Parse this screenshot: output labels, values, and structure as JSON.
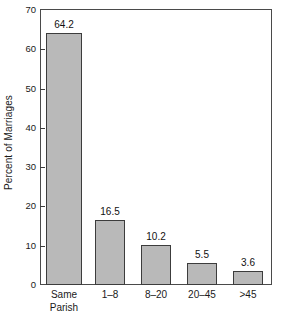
{
  "chart_data": {
    "type": "bar",
    "title": "",
    "xlabel": "",
    "ylabel": "Percent of Marriages",
    "categories": [
      "Same Parish",
      "1–8",
      "8–20",
      "20–45",
      ">45"
    ],
    "category_lines": [
      [
        "Same",
        "Parish"
      ],
      [
        "1–8"
      ],
      [
        "8–20"
      ],
      [
        "20–45"
      ],
      [
        ">45"
      ]
    ],
    "values": [
      64.2,
      16.5,
      10.2,
      5.5,
      3.6
    ],
    "value_labels": [
      "64.2",
      "16.5",
      "10.2",
      "5.5",
      "3.6"
    ],
    "ylim": [
      0,
      70
    ],
    "yticks": [
      0,
      10,
      20,
      30,
      40,
      50,
      60,
      70
    ],
    "ytick_labels": [
      "0",
      "10",
      "20",
      "30",
      "40",
      "50",
      "60",
      "70"
    ],
    "grid": false,
    "legend": null,
    "bar_fill_color": "#b9b9b9",
    "bar_edge_color": "#3c3c3c",
    "axis_color": "#4a4a4a"
  }
}
